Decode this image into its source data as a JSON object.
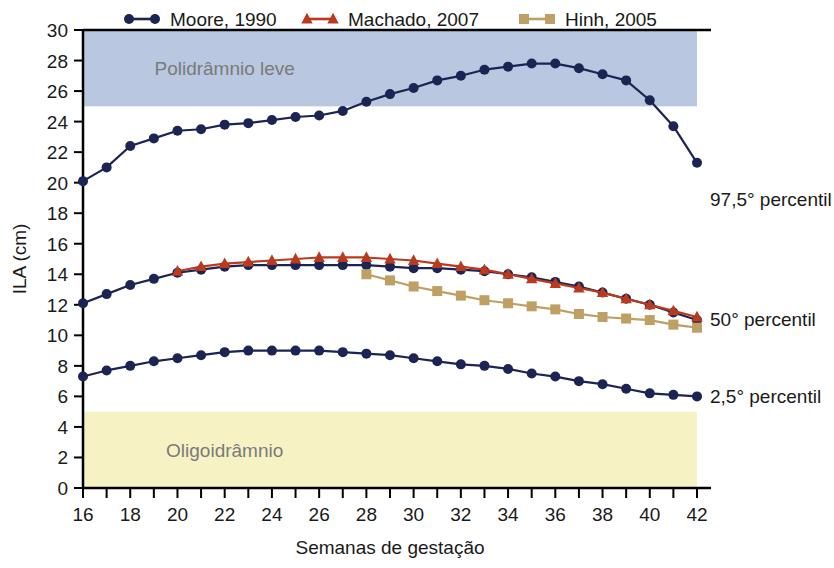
{
  "chart_data": {
    "type": "line",
    "title": "",
    "xlabel": "Semanas de gestação",
    "ylabel": "ILA (cm)",
    "xlim": [
      16,
      42
    ],
    "ylim": [
      0,
      30
    ],
    "x_tick_step": 2,
    "y_tick_step": 2,
    "x_ticks": [
      16,
      17,
      18,
      19,
      20,
      21,
      22,
      23,
      24,
      25,
      26,
      27,
      28,
      29,
      30,
      31,
      32,
      33,
      34,
      35,
      36,
      37,
      38,
      39,
      40,
      41,
      42
    ],
    "x_tick_labels": [
      "16",
      "",
      "18",
      "",
      "20",
      "",
      "22",
      "",
      "24",
      "",
      "26",
      "",
      "28",
      "",
      "30",
      "",
      "32",
      "",
      "34",
      "",
      "36",
      "",
      "38",
      "",
      "40",
      "",
      "42"
    ],
    "y_ticks": [
      0,
      2,
      4,
      6,
      8,
      10,
      12,
      14,
      16,
      18,
      20,
      22,
      24,
      26,
      28,
      30
    ],
    "y_tick_labels": [
      "0",
      "2",
      "4",
      "6",
      "8",
      "10",
      "12",
      "14",
      "16",
      "18",
      "20",
      "22",
      "24",
      "26",
      "28",
      "30"
    ],
    "grid": false,
    "legend_position": "top",
    "legend": [
      {
        "name": "Moore, 1990",
        "color": "#1b2452",
        "marker": "circle"
      },
      {
        "name": "Machado, 2007",
        "color": "#b93a1e",
        "marker": "triangle"
      },
      {
        "name": "Hinh, 2005",
        "color": "#bfa064",
        "marker": "square"
      }
    ],
    "bands": [
      {
        "label": "Polidrâmnio leve",
        "y_from": 25,
        "y_to": 30,
        "color": "#b9c8e0",
        "label_x": 22.0
      },
      {
        "label": "Oligoidrâmnio",
        "y_from": 0,
        "y_to": 5,
        "color": "#f7f2c4",
        "label_x": 22.0
      }
    ],
    "annotations": [
      {
        "text": "97,5° percentil",
        "x": 42,
        "y": 18.9
      },
      {
        "text": "50° percentil",
        "x": 42,
        "y": 11.1
      },
      {
        "text": "2,5° percentil",
        "x": 42,
        "y": 6.0
      }
    ],
    "series": [
      {
        "name": "Moore, 1990",
        "percentile": "97,5° percentil",
        "color": "#1b2452",
        "marker": "circle",
        "x": [
          16,
          17,
          18,
          19,
          20,
          21,
          22,
          23,
          24,
          25,
          26,
          27,
          28,
          29,
          30,
          31,
          32,
          33,
          34,
          35,
          36,
          37,
          38,
          39,
          40,
          41,
          42
        ],
        "values": [
          20.1,
          21.0,
          22.4,
          22.9,
          23.4,
          23.5,
          23.8,
          23.9,
          24.1,
          24.3,
          24.4,
          24.7,
          25.3,
          25.8,
          26.2,
          26.7,
          27.0,
          27.4,
          27.6,
          27.8,
          27.8,
          27.5,
          27.1,
          26.7,
          25.4,
          23.7,
          21.3
        ]
      },
      {
        "name": "Moore, 1990",
        "percentile": "50° percentil",
        "color": "#1b2452",
        "marker": "circle",
        "x": [
          16,
          17,
          18,
          19,
          20,
          21,
          22,
          23,
          24,
          25,
          26,
          27,
          28,
          29,
          30,
          31,
          32,
          33,
          34,
          35,
          36,
          37,
          38,
          39,
          40,
          41,
          42
        ],
        "values": [
          12.1,
          12.7,
          13.3,
          13.7,
          14.1,
          14.3,
          14.5,
          14.6,
          14.6,
          14.6,
          14.6,
          14.6,
          14.6,
          14.5,
          14.4,
          14.4,
          14.3,
          14.2,
          14.0,
          13.8,
          13.5,
          13.2,
          12.8,
          12.4,
          12.0,
          11.5,
          11.0
        ]
      },
      {
        "name": "Moore, 1990",
        "percentile": "2,5° percentil",
        "color": "#1b2452",
        "marker": "circle",
        "x": [
          16,
          17,
          18,
          19,
          20,
          21,
          22,
          23,
          24,
          25,
          26,
          27,
          28,
          29,
          30,
          31,
          32,
          33,
          34,
          35,
          36,
          37,
          38,
          39,
          40,
          41,
          42
        ],
        "values": [
          7.3,
          7.7,
          8.0,
          8.3,
          8.5,
          8.7,
          8.9,
          9.0,
          9.0,
          9.0,
          9.0,
          8.9,
          8.8,
          8.7,
          8.5,
          8.3,
          8.1,
          8.0,
          7.8,
          7.5,
          7.3,
          7.0,
          6.8,
          6.5,
          6.2,
          6.1,
          6.0
        ]
      },
      {
        "name": "Machado, 2007",
        "percentile": "50° percentil",
        "color": "#b93a1e",
        "marker": "triangle",
        "x": [
          20,
          21,
          22,
          23,
          24,
          25,
          26,
          27,
          28,
          29,
          30,
          31,
          32,
          33,
          34,
          35,
          36,
          37,
          38,
          39,
          40,
          41,
          42
        ],
        "values": [
          14.2,
          14.5,
          14.7,
          14.8,
          14.9,
          15.0,
          15.1,
          15.1,
          15.1,
          15.0,
          14.9,
          14.7,
          14.5,
          14.3,
          14.0,
          13.7,
          13.4,
          13.1,
          12.8,
          12.4,
          12.0,
          11.6,
          11.2
        ]
      },
      {
        "name": "Hinh, 2005",
        "percentile": "50° percentil",
        "color": "#bfa064",
        "marker": "square",
        "x": [
          28,
          29,
          30,
          31,
          32,
          33,
          34,
          35,
          36,
          37,
          38,
          39,
          40,
          41,
          42
        ],
        "values": [
          14.0,
          13.6,
          13.2,
          12.9,
          12.6,
          12.3,
          12.1,
          11.9,
          11.7,
          11.4,
          11.2,
          11.1,
          11.0,
          10.7,
          10.5
        ]
      }
    ]
  },
  "figure": {
    "background": "#ffffff",
    "axis_color": "#000000",
    "band_label_color": "#7a7a7a"
  }
}
